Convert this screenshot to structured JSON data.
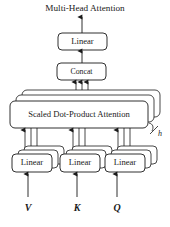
{
  "figure": {
    "title": "Multi-Head Attention",
    "nodes": {
      "output_linear": "Linear",
      "concat": "Concat",
      "attention": "Scaled Dot-Product Attention",
      "linear_v": "Linear",
      "linear_k": "Linear",
      "linear_q": "Linear"
    },
    "inputs": {
      "v": "V",
      "k": "K",
      "q": "Q"
    },
    "annotations": {
      "head_count": "h"
    },
    "colors": {
      "stroke": "#1a1a1a",
      "fill": "#ffffff",
      "background": "#ffffff"
    }
  }
}
